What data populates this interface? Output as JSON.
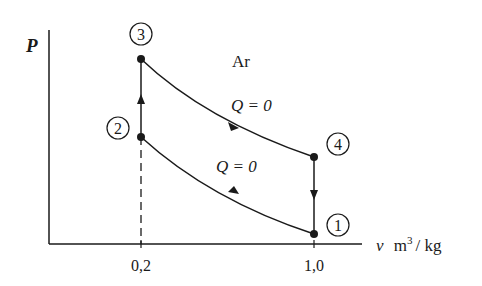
{
  "diagram": {
    "gas_label": "Ar",
    "y_axis_label": "P",
    "x_axis_label_var": "v",
    "x_axis_label_unit": "m",
    "x_axis_label_exp": "3",
    "x_axis_label_rest": "/ kg",
    "x_ticks": [
      "0,2",
      "1,0"
    ],
    "states": [
      {
        "id": "1",
        "label": "1",
        "v": 1.0,
        "position": "bottom-right"
      },
      {
        "id": "2",
        "label": "2",
        "v": 0.2,
        "position": "left-middle"
      },
      {
        "id": "3",
        "label": "3",
        "v": 0.2,
        "position": "top-left"
      },
      {
        "id": "4",
        "label": "4",
        "v": 1.0,
        "position": "right-middle"
      }
    ],
    "processes": [
      {
        "from": "1",
        "to": "2",
        "type": "adiabatic compression",
        "label": "Q = 0"
      },
      {
        "from": "2",
        "to": "3",
        "type": "isochoric heating",
        "label": ""
      },
      {
        "from": "3",
        "to": "4",
        "type": "adiabatic expansion",
        "label": "Q = 0"
      },
      {
        "from": "4",
        "to": "1",
        "type": "isochoric cooling",
        "label": ""
      }
    ],
    "upper_q_label": "Q = 0",
    "lower_q_label": "Q = 0",
    "colors": {
      "line": "#1a1a1a",
      "background": "#ffffff"
    }
  }
}
